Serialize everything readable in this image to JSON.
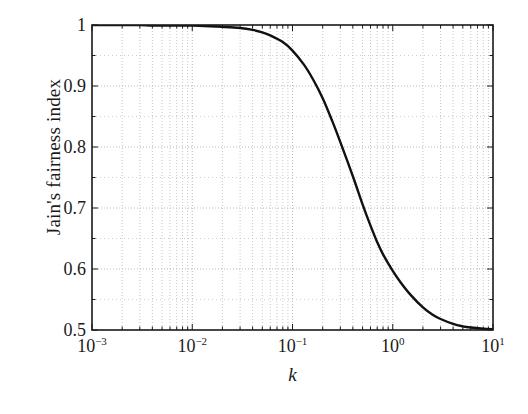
{
  "chart_data": {
    "type": "line",
    "title": "",
    "xlabel": "k",
    "ylabel": "Jain's fairness index",
    "xscale": "log",
    "yscale": "linear",
    "xlim": [
      0.001,
      10
    ],
    "ylim": [
      0.5,
      1.0
    ],
    "grid": true,
    "grid_style": "dotted",
    "minor_grid": true,
    "legend": null,
    "xtick_labels": [
      "10-3",
      "10-2",
      "10-1",
      "100",
      "101"
    ],
    "xticks": [
      0.001,
      0.01,
      0.1,
      1,
      10
    ],
    "xtick_mantissas": [
      "10",
      "10",
      "10",
      "10",
      "10"
    ],
    "xtick_exponents": [
      "-3",
      "-2",
      "-1",
      "0",
      "1"
    ],
    "ytick_labels": [
      "1",
      "0.9",
      "0.8",
      "0.7",
      "0.6",
      "0.5"
    ],
    "yticks": [
      1.0,
      0.9,
      0.8,
      0.7,
      0.6,
      0.5
    ],
    "series": [
      {
        "name": "Jain's fairness index",
        "color": "#111111",
        "linewidth": 2.4,
        "x": [
          0.001,
          0.0015,
          0.002,
          0.003,
          0.004,
          0.006,
          0.008,
          0.01,
          0.015,
          0.02,
          0.03,
          0.04,
          0.05,
          0.06,
          0.08,
          0.1,
          0.13,
          0.16,
          0.2,
          0.25,
          0.3,
          0.4,
          0.5,
          0.6,
          0.7,
          0.8,
          1.0,
          1.2,
          1.5,
          2.0,
          2.5,
          3.0,
          4.0,
          5.0,
          6.0,
          8.0,
          10.0
        ],
        "y": [
          1.0,
          1.0,
          1.0,
          1.0,
          0.999,
          0.999,
          0.999,
          0.999,
          0.998,
          0.997,
          0.995,
          0.992,
          0.988,
          0.983,
          0.972,
          0.958,
          0.935,
          0.911,
          0.88,
          0.842,
          0.808,
          0.752,
          0.706,
          0.671,
          0.644,
          0.624,
          0.597,
          0.578,
          0.558,
          0.537,
          0.525,
          0.518,
          0.51,
          0.506,
          0.504,
          0.502,
          0.501
        ]
      }
    ]
  },
  "axes": {
    "frame_color": "#1a1a1a",
    "grid_color": "#b9b9b9",
    "background": "#ffffff"
  }
}
